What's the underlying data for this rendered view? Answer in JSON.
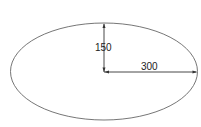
{
  "diagram": {
    "shape": "ellipse",
    "semi_minor_label": "150",
    "semi_major_label": "300",
    "colors": {
      "stroke": "#555555",
      "dimension": "#333333",
      "background": "#ffffff"
    }
  }
}
